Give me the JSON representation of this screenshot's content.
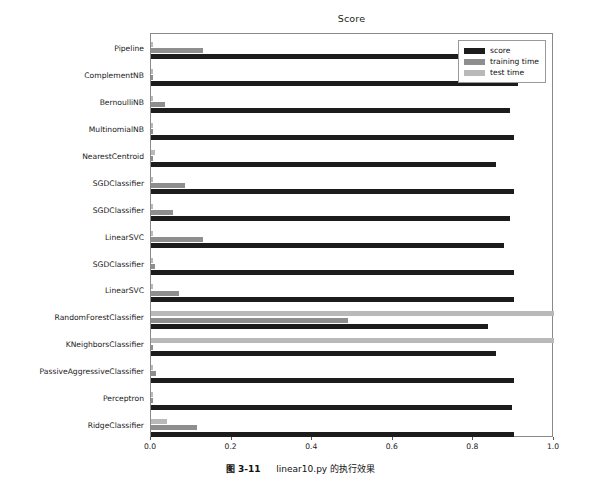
{
  "chart_data": {
    "type": "bar",
    "orientation": "horizontal",
    "title": "Score",
    "xlabel": "",
    "ylabel": "",
    "xlim": [
      0.0,
      1.0
    ],
    "xticks": [
      "0.0",
      "0.2",
      "0.4",
      "0.6",
      "0.8",
      "1.0"
    ],
    "xtick_values": [
      0.0,
      0.2,
      0.4,
      0.6,
      0.8,
      1.0
    ],
    "grid": false,
    "legend_position": "upper right",
    "categories": [
      "Pipeline",
      "ComplementNB",
      "BernoulliNB",
      "MultinomialNB",
      "NearestCentroid",
      "SGDClassifier",
      "SGDClassifier",
      "LinearSVC",
      "SGDClassifier",
      "LinearSVC",
      "RandomForestClassifier",
      "KNeighborsClassifier",
      "PassiveAggressiveClassifier",
      "Perceptron",
      "RidgeClassifier"
    ],
    "series": [
      {
        "name": "score",
        "color": "#1c1c1c",
        "values": [
          0.855,
          0.91,
          0.89,
          0.9,
          0.855,
          0.9,
          0.89,
          0.875,
          0.9,
          0.9,
          0.835,
          0.855,
          0.9,
          0.895,
          0.9
        ]
      },
      {
        "name": "training time",
        "color": "#8e8e8e",
        "values": [
          0.13,
          0.004,
          0.035,
          0.004,
          0.004,
          0.085,
          0.055,
          0.13,
          0.01,
          0.07,
          0.49,
          0.004,
          0.013,
          0.006,
          0.115
        ]
      },
      {
        "name": "test time",
        "color": "#b9b9b9",
        "values": [
          0.006,
          0.004,
          0.006,
          0.004,
          0.01,
          0.004,
          0.005,
          0.005,
          0.005,
          0.004,
          1.0,
          1.0,
          0.006,
          0.005,
          0.04
        ]
      }
    ]
  },
  "legend": {
    "items": [
      {
        "label": "score",
        "key": "score"
      },
      {
        "label": "training time",
        "key": "train"
      },
      {
        "label": "test time",
        "key": "test"
      }
    ]
  },
  "caption": {
    "number": "图 3-11",
    "text": "linear10.py 的执行效果"
  }
}
